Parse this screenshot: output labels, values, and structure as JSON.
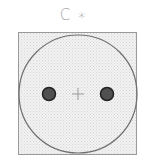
{
  "symbol": {
    "label": "C ∗",
    "type": "type-c-plug-socket",
    "colors": {
      "background": "#ffffff",
      "square_fill": "#ececec",
      "square_stroke": "#9a9a9a",
      "circle_stroke": "#6e6e6e",
      "pin_fill": "#505050",
      "pin_stroke": "#222222",
      "center_mark": "#999999",
      "label": "#a8a8a8"
    }
  }
}
